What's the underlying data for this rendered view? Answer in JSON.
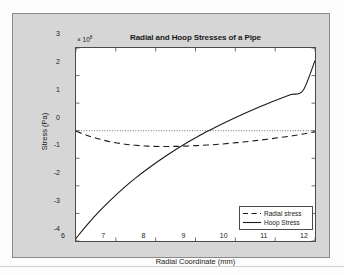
{
  "figure": {
    "background_color": "#d6d6d6",
    "plot_background_color": "#ffffff",
    "axis_color": "#4a4a4a",
    "line_color": "#1a1a1a"
  },
  "chart_data": {
    "type": "line",
    "title": "Radial and Hoop Stresses of a Pipe",
    "xlabel": "Radial Coordinate (mm)",
    "ylabel": "Stress (Pa)",
    "y_exponent_label": "× 10",
    "y_exponent_power": "8",
    "y_scale": 100000000.0,
    "xlim": [
      6,
      12
    ],
    "ylim": [
      -4,
      3
    ],
    "xticks": [
      6,
      7,
      8,
      9,
      10,
      11,
      12
    ],
    "xtick_labels": [
      "6",
      "7",
      "8",
      "9",
      "10",
      "11",
      "12"
    ],
    "yticks": [
      3,
      2,
      1,
      0,
      -1,
      -2,
      -3,
      -4
    ],
    "ytick_labels": [
      "3",
      "2",
      "1",
      "0",
      "-1",
      "-2",
      "-3",
      "-4"
    ],
    "grid": false,
    "box": true,
    "zero_reference_line": {
      "value": 0,
      "style": "dotted",
      "color": "#555555"
    },
    "legend_position": "lower right",
    "x": [
      6.0,
      6.3,
      6.6,
      6.9,
      7.2,
      7.5,
      7.8,
      8.1,
      8.4,
      8.7,
      9.0,
      9.3,
      9.6,
      9.9,
      10.2,
      10.5,
      10.8,
      11.1,
      11.4,
      11.7,
      12.0
    ],
    "series": [
      {
        "name": "Radial stress",
        "style": "dashed",
        "color": "#1a1a1a",
        "values": [
          -0.02,
          -0.18,
          -0.31,
          -0.41,
          -0.48,
          -0.53,
          -0.56,
          -0.57,
          -0.57,
          -0.56,
          -0.54,
          -0.52,
          -0.49,
          -0.45,
          -0.41,
          -0.36,
          -0.31,
          -0.25,
          -0.19,
          -0.12,
          -0.04
        ]
      },
      {
        "name": "Hoop Stress",
        "style": "solid",
        "color": "#1a1a1a",
        "values": [
          -3.9,
          -3.38,
          -2.9,
          -2.47,
          -2.07,
          -1.71,
          -1.38,
          -1.07,
          -0.78,
          -0.51,
          -0.26,
          -0.02,
          0.2,
          0.41,
          0.61,
          0.8,
          0.98,
          1.15,
          1.31,
          1.46,
          2.55
        ]
      }
    ],
    "annotations": []
  },
  "legend": {
    "items": [
      {
        "label": "Radial stress",
        "style": "dashed"
      },
      {
        "label": "Hoop Stress",
        "style": "solid"
      }
    ]
  }
}
